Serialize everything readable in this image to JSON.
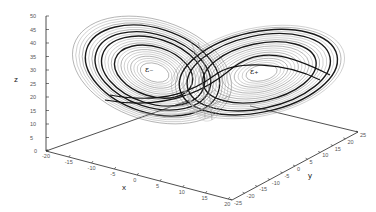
{
  "chart_data": {
    "type": "line",
    "title": "",
    "subtitle": "",
    "xlabel": "x",
    "ylabel": "y",
    "zlabel": "z",
    "xlim": [
      -20,
      20
    ],
    "ylim": [
      -25,
      25
    ],
    "zlim": [
      0,
      50
    ],
    "x_ticks": [
      "-20",
      "-15",
      "-10",
      "-5",
      "0",
      "5",
      "10",
      "15",
      "20"
    ],
    "y_ticks": [
      "-25",
      "-20",
      "-15",
      "-10",
      "-5",
      "0",
      "5",
      "10",
      "15",
      "20",
      "25"
    ],
    "z_ticks": [
      "0",
      "5",
      "10",
      "15",
      "20",
      "25",
      "30",
      "35",
      "40",
      "45",
      "50"
    ],
    "grid": false,
    "legend": null,
    "annotations": [
      {
        "text": "ε₋",
        "near": "left lobe center",
        "approx_xyz": [
          -8.5,
          -8.5,
          27
        ]
      },
      {
        "text": "ε₊",
        "near": "right lobe center",
        "approx_xyz": [
          8.5,
          8.5,
          27
        ]
      }
    ],
    "series": [
      {
        "name": "trajectory",
        "style": "gray thin and dark thick lines",
        "color": "#555555"
      }
    ]
  },
  "axes": {
    "x_label": "x",
    "y_label": "y",
    "z_label": "z"
  },
  "fixed_points": {
    "minus": "ε₋",
    "plus": "ε₊"
  }
}
